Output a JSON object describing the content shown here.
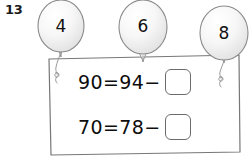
{
  "exercise": {
    "number": "13"
  },
  "balloons": [
    {
      "icon": "balloon-icon",
      "label": "4"
    },
    {
      "icon": "balloon-icon",
      "label": "6"
    },
    {
      "icon": "balloon-icon",
      "label": "8"
    }
  ],
  "equations": [
    {
      "expression": "90=94−",
      "answer": "",
      "answer_placeholder": ""
    },
    {
      "expression": "70=78−",
      "answer": "",
      "answer_placeholder": ""
    }
  ],
  "colors": {
    "ink": "#0d0d0d",
    "outline": "#6b6b6b",
    "balloon_fill": "#f4f4f4",
    "background": "#ffffff"
  }
}
